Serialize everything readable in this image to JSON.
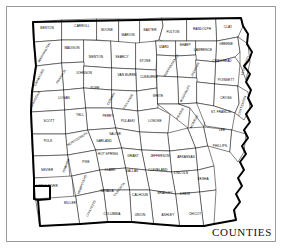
{
  "map": {
    "title": "COUNTIES",
    "state": "Arkansas",
    "colors": {
      "background": "#ffffff",
      "frame": "#9a9a9a",
      "county_border": "#1a1a1a",
      "state_outline": "#000000",
      "label": "#000000"
    },
    "counties": [
      {
        "name": "BENTON",
        "x": 47,
        "y": 29,
        "rot": 0
      },
      {
        "name": "CARROLL",
        "x": 82,
        "y": 27,
        "rot": 0
      },
      {
        "name": "BOONE",
        "x": 107,
        "y": 31,
        "rot": 0
      },
      {
        "name": "MARION",
        "x": 128,
        "y": 36,
        "rot": 0
      },
      {
        "name": "BAXTER",
        "x": 150,
        "y": 31,
        "rot": 0
      },
      {
        "name": "FULTON",
        "x": 173,
        "y": 33,
        "rot": 0
      },
      {
        "name": "RANDOLPH",
        "x": 202,
        "y": 30,
        "rot": 0
      },
      {
        "name": "CLAY",
        "x": 228,
        "y": 28,
        "rot": 0
      },
      {
        "name": "MADISON",
        "x": 72,
        "y": 49,
        "rot": 0
      },
      {
        "name": "NEWTON",
        "x": 96,
        "y": 58,
        "rot": 0
      },
      {
        "name": "SEARCY",
        "x": 122,
        "y": 58,
        "rot": 0
      },
      {
        "name": "STONE",
        "x": 145,
        "y": 62,
        "rot": 0
      },
      {
        "name": "IZARD",
        "x": 164,
        "y": 48,
        "rot": 0
      },
      {
        "name": "SHARP",
        "x": 185,
        "y": 46,
        "rot": 0
      },
      {
        "name": "LAWRENCE",
        "x": 203,
        "y": 51,
        "rot": 0
      },
      {
        "name": "GREENE",
        "x": 226,
        "y": 45,
        "rot": 0
      },
      {
        "name": "WASHINGTON",
        "x": 45,
        "y": 53,
        "rot": -60
      },
      {
        "name": "CRAWFORD",
        "x": 40,
        "y": 78,
        "rot": -62
      },
      {
        "name": "FRANKLIN",
        "x": 62,
        "y": 77,
        "rot": -58
      },
      {
        "name": "JOHNSON",
        "x": 84,
        "y": 74,
        "rot": 0
      },
      {
        "name": "VAN BUREN",
        "x": 127,
        "y": 76,
        "rot": 0
      },
      {
        "name": "CLEBURNE",
        "x": 149,
        "y": 78,
        "rot": 0
      },
      {
        "name": "INDEPENDENCE",
        "x": 172,
        "y": 66,
        "rot": -58
      },
      {
        "name": "JACKSON",
        "x": 196,
        "y": 70,
        "rot": -62
      },
      {
        "name": "CRAIGHEAD",
        "x": 222,
        "y": 62,
        "rot": 0
      },
      {
        "name": "POINSETT",
        "x": 226,
        "y": 81,
        "rot": 0
      },
      {
        "name": "SEBASTIAN",
        "x": 36,
        "y": 100,
        "rot": -62
      },
      {
        "name": "POPE",
        "x": 95,
        "y": 89,
        "rot": 0
      },
      {
        "name": "CONWAY",
        "x": 112,
        "y": 99,
        "rot": -60
      },
      {
        "name": "WHITE",
        "x": 158,
        "y": 97,
        "rot": 0
      },
      {
        "name": "WOODRUFF",
        "x": 186,
        "y": 94,
        "rot": -62
      },
      {
        "name": "CROSS",
        "x": 226,
        "y": 99,
        "rot": 0
      },
      {
        "name": "LOGAN",
        "x": 64,
        "y": 99,
        "rot": 0
      },
      {
        "name": "SCOTT",
        "x": 49,
        "y": 122,
        "rot": 0
      },
      {
        "name": "YELL",
        "x": 80,
        "y": 116,
        "rot": 0
      },
      {
        "name": "PERRY",
        "x": 108,
        "y": 117,
        "rot": 0
      },
      {
        "name": "FAULKNER",
        "x": 129,
        "y": 102,
        "rot": -58
      },
      {
        "name": "PRAIRIE",
        "x": 181,
        "y": 114,
        "rot": -60
      },
      {
        "name": "ST. FRANCIS",
        "x": 221,
        "y": 113,
        "rot": 0
      },
      {
        "name": "PULASKI",
        "x": 128,
        "y": 122,
        "rot": 0
      },
      {
        "name": "LONOKE",
        "x": 155,
        "y": 122,
        "rot": 0
      },
      {
        "name": "MONROE",
        "x": 195,
        "y": 122,
        "rot": -62
      },
      {
        "name": "LEE",
        "x": 222,
        "y": 131,
        "rot": 0
      },
      {
        "name": "SALINE",
        "x": 115,
        "y": 135,
        "rot": 0
      },
      {
        "name": "MONTGOMERY",
        "x": 78,
        "y": 140,
        "rot": -32
      },
      {
        "name": "POLK",
        "x": 48,
        "y": 142,
        "rot": 0
      },
      {
        "name": "GARLAND",
        "x": 104,
        "y": 142,
        "rot": 0
      },
      {
        "name": "HOT SPRING",
        "x": 108,
        "y": 155,
        "rot": 0
      },
      {
        "name": "GRANT",
        "x": 133,
        "y": 157,
        "rot": 0
      },
      {
        "name": "JEFFERSON",
        "x": 160,
        "y": 157,
        "rot": 0
      },
      {
        "name": "ARKANSAS",
        "x": 186,
        "y": 158,
        "rot": 0
      },
      {
        "name": "PHILLIPS",
        "x": 220,
        "y": 147,
        "rot": 0
      },
      {
        "name": "SEVIER",
        "x": 47,
        "y": 171,
        "rot": 0
      },
      {
        "name": "HOWARD",
        "x": 67,
        "y": 166,
        "rot": -68
      },
      {
        "name": "PIKE",
        "x": 86,
        "y": 163,
        "rot": 0
      },
      {
        "name": "CLARK",
        "x": 110,
        "y": 171,
        "rot": 0
      },
      {
        "name": "DALLAS",
        "x": 132,
        "y": 172,
        "rot": 0
      },
      {
        "name": "CLEVELAND",
        "x": 158,
        "y": 171,
        "rot": 0
      },
      {
        "name": "LINCOLN",
        "x": 181,
        "y": 174,
        "rot": 0
      },
      {
        "name": "DESHA",
        "x": 203,
        "y": 180,
        "rot": 0
      },
      {
        "name": "LITTLE RIVER",
        "x": 47,
        "y": 187,
        "rot": 0
      },
      {
        "name": "HEMPSTEAD",
        "x": 83,
        "y": 185,
        "rot": -68
      },
      {
        "name": "NEVADA",
        "x": 107,
        "y": 192,
        "rot": 0
      },
      {
        "name": "OUACHITA",
        "x": 120,
        "y": 190,
        "rot": -52
      },
      {
        "name": "CALHOUN",
        "x": 140,
        "y": 196,
        "rot": 0
      },
      {
        "name": "BRADLEY",
        "x": 165,
        "y": 194,
        "rot": 0
      },
      {
        "name": "DREW",
        "x": 185,
        "y": 195,
        "rot": 0
      },
      {
        "name": "MILLER",
        "x": 70,
        "y": 204,
        "rot": 0
      },
      {
        "name": "LAFAYETTE",
        "x": 92,
        "y": 209,
        "rot": -62
      },
      {
        "name": "COLUMBIA",
        "x": 112,
        "y": 215,
        "rot": 0
      },
      {
        "name": "UNION",
        "x": 140,
        "y": 216,
        "rot": 0
      },
      {
        "name": "ASHLEY",
        "x": 168,
        "y": 216,
        "rot": 0
      },
      {
        "name": "CHICOT",
        "x": 195,
        "y": 215,
        "rot": 0
      },
      {
        "name": "MISSISSIPPI",
        "x": 246,
        "y": 66,
        "rot": -72
      },
      {
        "name": "CRITTENDEN",
        "x": 243,
        "y": 106,
        "rot": -72
      }
    ]
  }
}
